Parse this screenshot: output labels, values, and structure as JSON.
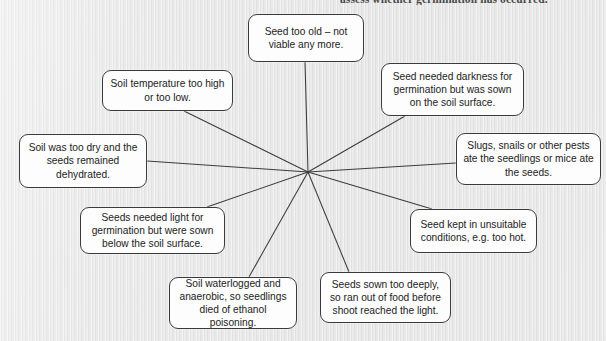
{
  "page": {
    "width": 606,
    "height": 341,
    "background_color": "#e4e4e4",
    "clipped_heading": "assess whether germination has occurred."
  },
  "diagram": {
    "type": "spider",
    "hub": {
      "x": 308,
      "y": 172
    },
    "line_color": "#3c3c3c",
    "node_border_color": "#3a3a3a",
    "node_fill_color": "#fdfdfd",
    "nodes": [
      {
        "id": "seed-too-old",
        "text": "Seed too old – not viable any more.",
        "x": 248,
        "y": 14,
        "w": 116,
        "h": 48,
        "anchor_x": 305,
        "anchor_y": 62
      },
      {
        "id": "soil-temperature",
        "text": "Soil temperature too high or too low.",
        "x": 102,
        "y": 70,
        "w": 131,
        "h": 41,
        "anchor_x": 184,
        "anchor_y": 111
      },
      {
        "id": "seed-needed-darkness",
        "text": "Seed needed darkness for germination but was sown on the soil surface.",
        "x": 381,
        "y": 63,
        "w": 143,
        "h": 53,
        "anchor_x": 405,
        "anchor_y": 116
      },
      {
        "id": "soil-too-dry",
        "text": "Soil was too dry and the seeds remained dehydrated.",
        "x": 19,
        "y": 134,
        "w": 128,
        "h": 54,
        "anchor_x": 147,
        "anchor_y": 161
      },
      {
        "id": "slugs-snails-pests",
        "text": "Slugs, snails or other pests ate the seedlings or mice ate the seeds.",
        "x": 456,
        "y": 133,
        "w": 145,
        "h": 52,
        "anchor_x": 456,
        "anchor_y": 163
      },
      {
        "id": "seeds-needed-light",
        "text": "Seeds needed light for germination but were sown below the soil surface.",
        "x": 80,
        "y": 207,
        "w": 145,
        "h": 47,
        "anchor_x": 207,
        "anchor_y": 207
      },
      {
        "id": "seed-kept-unsuitable",
        "text": "Seed kept in unsuitable conditions, e.g. too hot.",
        "x": 410,
        "y": 209,
        "w": 127,
        "h": 44,
        "anchor_x": 432,
        "anchor_y": 209
      },
      {
        "id": "soil-waterlogged",
        "text": "Soil waterlogged and anaerobic, so seedlings died of ethanol poisoning.",
        "x": 169,
        "y": 277,
        "w": 128,
        "h": 52,
        "anchor_x": 249,
        "anchor_y": 277
      },
      {
        "id": "seeds-sown-too-deeply",
        "text": "Seeds sown too deeply, so ran out of food before shoot reached the light.",
        "x": 320,
        "y": 272,
        "w": 131,
        "h": 51,
        "anchor_x": 349,
        "anchor_y": 272
      }
    ]
  }
}
